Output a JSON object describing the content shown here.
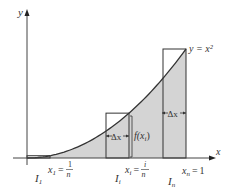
{
  "diagram": {
    "curve_label": "y = x²",
    "axes": {
      "x_label": "x",
      "y_label": "y"
    },
    "function": "x^2",
    "interval": [
      0,
      1
    ],
    "highlighted_intervals": [
      {
        "name": "I_1",
        "label": "I",
        "sub": "1",
        "endpoint_label": "x",
        "endpoint_sub": "1",
        "endpoint_value": "1/n",
        "num": "1",
        "den": "n"
      },
      {
        "name": "I_i",
        "label": "I",
        "sub": "i",
        "endpoint_label": "x",
        "endpoint_sub": "i",
        "endpoint_value": "i/n",
        "num": "i",
        "den": "n"
      },
      {
        "name": "I_n",
        "label": "I",
        "sub": "n",
        "endpoint_label": "x",
        "endpoint_sub": "n",
        "endpoint_value": "1",
        "num": "",
        "den": ""
      }
    ],
    "annotations": {
      "width_label": "Δx",
      "height_label": "f(x",
      "height_sub": "i",
      "height_close": ")",
      "equals": "=",
      "one": "1"
    },
    "colors": {
      "shade": "#d4d4d4",
      "stroke": "#333333",
      "axis": "#444444"
    }
  }
}
